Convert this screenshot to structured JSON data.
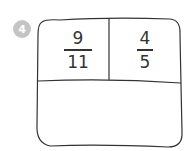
{
  "problem": {
    "number": "4",
    "fractions": [
      {
        "numerator": "9",
        "denominator": "11"
      },
      {
        "numerator": "4",
        "denominator": "5"
      }
    ],
    "answer_area": ""
  },
  "colors": {
    "badge": "#c4c4c4",
    "ink": "#333333"
  }
}
